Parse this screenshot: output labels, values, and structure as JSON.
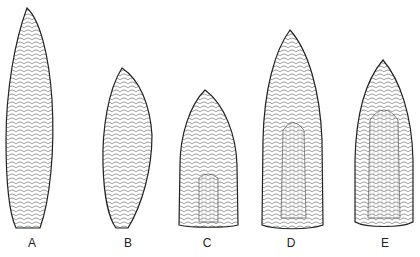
{
  "figure": {
    "points": [
      {
        "label": "A",
        "x": 32
      },
      {
        "label": "B",
        "x": 128
      },
      {
        "label": "C",
        "x": 207
      },
      {
        "label": "D",
        "x": 291
      },
      {
        "label": "E",
        "x": 385
      }
    ]
  }
}
